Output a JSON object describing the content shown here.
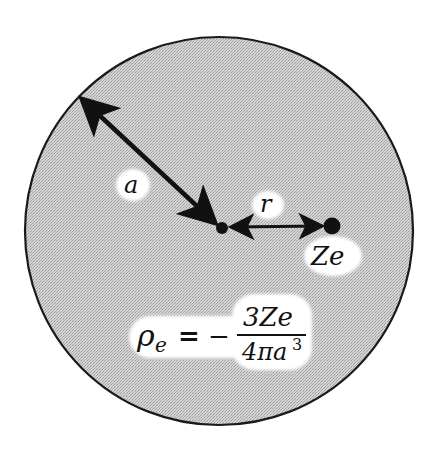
{
  "diagram": {
    "sphere": {
      "center": [
        219,
        231
      ],
      "radius": 194,
      "fill": "#c9c9c9",
      "stroke": "#1a1a1a"
    },
    "center_point": {
      "x": 222,
      "y": 228,
      "r": 6
    },
    "charge_point": {
      "x": 332,
      "y": 226,
      "r": 8
    },
    "labels": {
      "radius_label": "a",
      "distance_label": "r",
      "charge_label": "Ze"
    },
    "formula": {
      "lhs_symbol": "ρ",
      "lhs_subscript": "e",
      "equals": "=",
      "sign": "−",
      "numerator": "3Ze",
      "denominator_prefix": "4πa",
      "denominator_exponent": "3"
    },
    "colors": {
      "ink": "#111111",
      "halo": "#ffffff",
      "background": "#ffffff"
    }
  }
}
